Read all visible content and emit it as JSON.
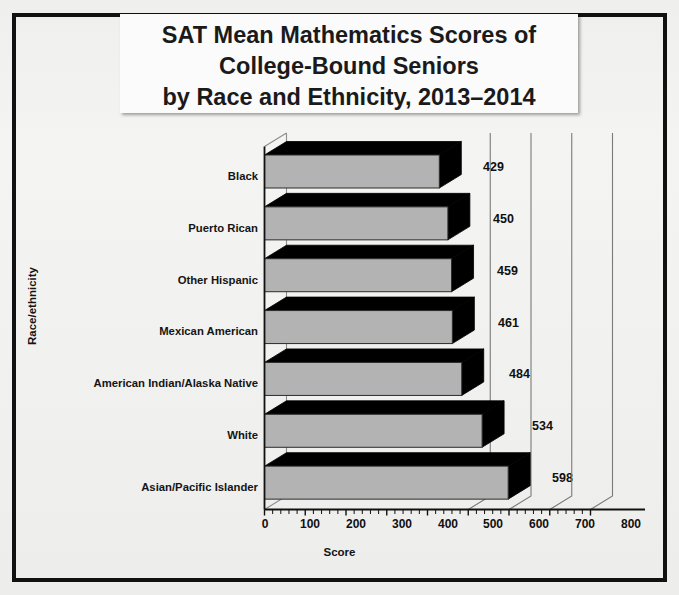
{
  "figure": {
    "title_lines": [
      "SAT Mean Mathematics Scores of",
      "College-Bound Seniors",
      "by Race and Ethnicity,  2013–2014"
    ],
    "frame_color": "#111111",
    "bar_face_color": "#b3b3b3",
    "bar_side_color": "#000000",
    "background_color": "#f1f1ef"
  },
  "chart_data": {
    "type": "bar",
    "orientation": "horizontal",
    "style": "3d",
    "title": "SAT Mean Mathematics Scores of College-Bound Seniors by Race and Ethnicity,  2013–2014",
    "xlabel": "Score",
    "ylabel": "Race/ethnicity",
    "categories": [
      "Black",
      "Puerto Rican",
      "Other Hispanic",
      "Mexican American",
      "American Indian/Alaska Native",
      "White",
      "Asian/Pacific Islander"
    ],
    "values": [
      429,
      450,
      459,
      461,
      484,
      534,
      598
    ],
    "data_labels": [
      "429",
      "450",
      "459",
      "461",
      "484",
      "534",
      "598"
    ],
    "xlim": [
      0,
      800
    ],
    "xticks": [
      0,
      100,
      200,
      300,
      400,
      500,
      600,
      700,
      800
    ],
    "xtick_labels": [
      "0",
      "100",
      "200",
      "300",
      "400",
      "500",
      "600",
      "700",
      "800"
    ],
    "minor_tick_interval": 20,
    "grid": "vertical-gridlines-on-back-wall",
    "legend": "none"
  }
}
